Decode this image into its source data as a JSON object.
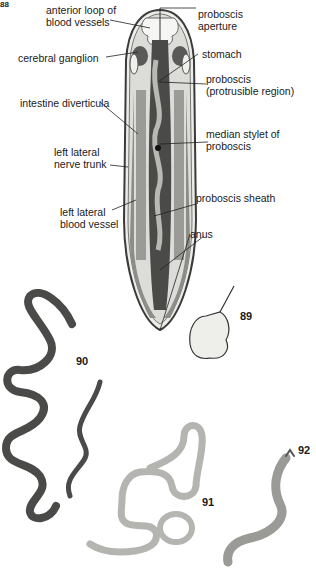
{
  "figure": {
    "corner_number": "88",
    "diagram_title_hidden": "",
    "labels": {
      "anterior_loop": "anterior loop of\nblood vessels",
      "cerebral_ganglion": "cerebral ganglion",
      "intestine_diverticula": "intestine diverticula",
      "left_lateral_nerve_trunk": "left lateral\nnerve trunk",
      "left_lateral_blood_vessel": "left lateral\nblood vessel",
      "proboscis_aperture": "proboscis\naperture",
      "stomach": "stomach",
      "proboscis_protrusible": "proboscis\n(protrusible region)",
      "median_stylet": "median stylet of\nproboscis",
      "proboscis_sheath": "proboscis sheath",
      "anus": "anus"
    },
    "specimen_numbers": {
      "n89": "89",
      "n90": "90",
      "n91": "91",
      "n92": "92"
    },
    "colors": {
      "outline": "#3a3a3a",
      "body_fill": "#e4e4e0",
      "dark_organ": "#5a5a58",
      "mid_organ": "#8c8c88",
      "worm90": "#4a4a48",
      "worm91": "#b4b4b0",
      "worm92": "#9a9a96"
    }
  }
}
